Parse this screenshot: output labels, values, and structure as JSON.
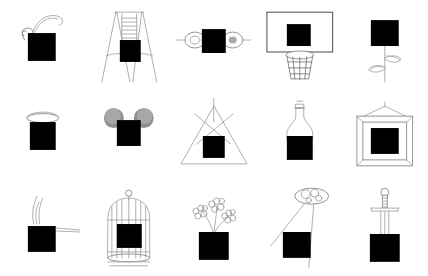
{
  "canvas": {
    "width": 428,
    "height": 276,
    "background": "#ffffff",
    "line_color": "#4a4a4a",
    "mask_color": "#000000",
    "fuzz_color": "#8f8f8f"
  },
  "grid": {
    "columns": 5,
    "rows": 3,
    "cell_count": 15
  },
  "cells": [
    {
      "index": 1,
      "row": 1,
      "col": 1,
      "name": "coconut-drink",
      "label": "Coconut drink with straw"
    },
    {
      "index": 2,
      "row": 1,
      "col": 2,
      "name": "swing-set",
      "label": "Swing set"
    },
    {
      "index": 3,
      "row": 1,
      "col": 3,
      "name": "dumbbell",
      "label": "Dumbbell"
    },
    {
      "index": 4,
      "row": 1,
      "col": 4,
      "name": "basketball-hoop",
      "label": "Basketball hoop"
    },
    {
      "index": 5,
      "row": 1,
      "col": 5,
      "name": "rose-flower",
      "label": "Rose on a stem"
    },
    {
      "index": 6,
      "row": 2,
      "col": 1,
      "name": "lidded-cup",
      "label": "Cup with lid"
    },
    {
      "index": 7,
      "row": 2,
      "col": 2,
      "name": "mouse-ears",
      "label": "Mouse ears"
    },
    {
      "index": 8,
      "row": 2,
      "col": 3,
      "name": "teepee-tent",
      "label": "Teepee tent"
    },
    {
      "index": 9,
      "row": 2,
      "col": 4,
      "name": "bottle-flask",
      "label": "Bottle"
    },
    {
      "index": 10,
      "row": 2,
      "col": 5,
      "name": "picture-frame",
      "label": "Hanging picture frame"
    },
    {
      "index": 11,
      "row": 3,
      "col": 1,
      "name": "smoking-ashtray",
      "label": "Smoking ashtray"
    },
    {
      "index": 12,
      "row": 3,
      "col": 2,
      "name": "birdcage",
      "label": "Birdcage"
    },
    {
      "index": 13,
      "row": 3,
      "col": 3,
      "name": "flower-pot",
      "label": "Flowers in a pot"
    },
    {
      "index": 14,
      "row": 3,
      "col": 4,
      "name": "balloon-kite",
      "label": "Balloons on strings"
    },
    {
      "index": 15,
      "row": 3,
      "col": 5,
      "name": "sword-in-stone",
      "label": "Sword in stone"
    }
  ]
}
